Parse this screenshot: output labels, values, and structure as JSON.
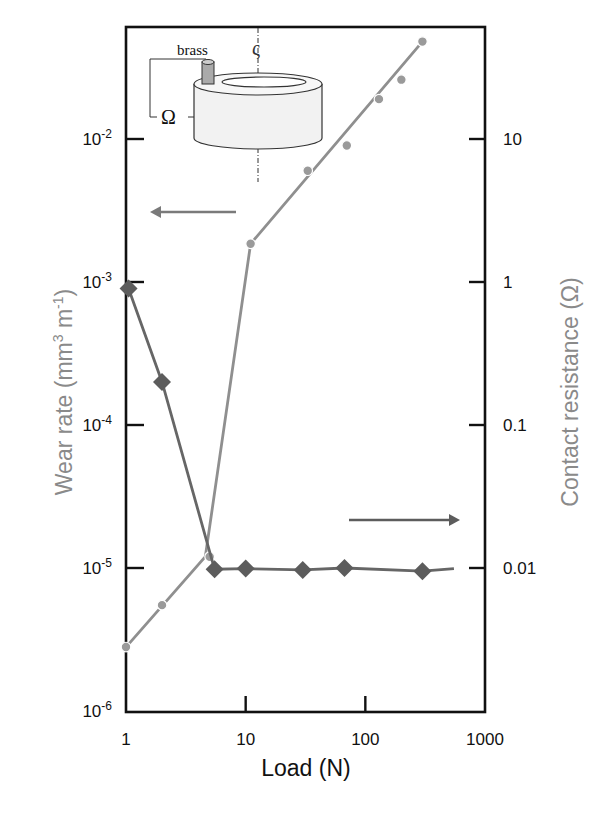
{
  "chart_data": {
    "type": "line",
    "title": "",
    "xlabel": "Load (N)",
    "ylabel": "Wear rate (mm3 m-1)",
    "ylabel_parts": {
      "base": "Wear rate (mm",
      "sup1": "3",
      "mid": " m",
      "sup2": "-1",
      "end": ")"
    },
    "y2label": "Contact resistance (Ω)",
    "xscale": "log",
    "yscale": "log",
    "xlim": [
      1,
      1000
    ],
    "ylim": [
      1e-06,
      0.06
    ],
    "y2lim": [
      0.001,
      60
    ],
    "x_ticks": [
      {
        "value": 1,
        "label": "1"
      },
      {
        "value": 10,
        "label": "10"
      },
      {
        "value": 100,
        "label": "100"
      },
      {
        "value": 1000,
        "label": "1000"
      }
    ],
    "y_ticks": [
      {
        "value": 1e-06,
        "base": "10",
        "exp": "-6"
      },
      {
        "value": 1e-05,
        "base": "10",
        "exp": "-5"
      },
      {
        "value": 0.0001,
        "base": "10",
        "exp": "-4"
      },
      {
        "value": 0.001,
        "base": "10",
        "exp": "-3"
      },
      {
        "value": 0.01,
        "base": "10",
        "exp": "-2"
      }
    ],
    "y2_ticks": [
      {
        "value": 0.01,
        "label": "0.01"
      },
      {
        "value": 0.1,
        "label": "0.1"
      },
      {
        "value": 1,
        "label": "1"
      },
      {
        "value": 10,
        "label": "10"
      }
    ],
    "grid": false,
    "series": [
      {
        "name": "Wear rate",
        "axis": "left",
        "marker": "circle",
        "color": "#9a9a9a",
        "points": [
          {
            "x": 1,
            "y": 2.8e-06
          },
          {
            "x": 2,
            "y": 5.5e-06
          },
          {
            "x": 5,
            "y": 1.2e-05
          },
          {
            "x": 11,
            "y": 0.00185
          },
          {
            "x": 33,
            "y": 0.006
          },
          {
            "x": 70,
            "y": 0.009
          },
          {
            "x": 130,
            "y": 0.019
          },
          {
            "x": 200,
            "y": 0.026
          },
          {
            "x": 300,
            "y": 0.048
          }
        ],
        "fit_line": [
          {
            "x": 1,
            "y": 2.8e-06
          },
          {
            "x": 4.6,
            "y": 1.2e-05
          },
          {
            "x": 11,
            "y": 0.00185
          },
          {
            "x": 300,
            "y": 0.048
          }
        ]
      },
      {
        "name": "Contact resistance",
        "axis": "right",
        "marker": "diamond",
        "color": "#5c5c5c",
        "points": [
          {
            "x": 1.05,
            "y": 0.9
          },
          {
            "x": 2,
            "y": 0.2
          },
          {
            "x": 5.5,
            "y": 0.0098
          },
          {
            "x": 10,
            "y": 0.0099
          },
          {
            "x": 30,
            "y": 0.0097
          },
          {
            "x": 67,
            "y": 0.01
          },
          {
            "x": 300,
            "y": 0.0095
          }
        ],
        "line_end": {
          "x": 550,
          "y": 0.0099
        }
      }
    ],
    "annotations": [
      {
        "type": "arrow",
        "direction": "left",
        "meaning": "wear rate refers to left axis"
      },
      {
        "type": "arrow",
        "direction": "right",
        "meaning": "contact resistance refers to right axis"
      },
      {
        "type": "inset",
        "description": "pin-on-ring schematic",
        "labels": [
          "brass",
          "Ω",
          "ς"
        ]
      }
    ]
  },
  "inset": {
    "brass_label": "brass",
    "ohm_label": "Ω",
    "rotation_label": "ς"
  }
}
